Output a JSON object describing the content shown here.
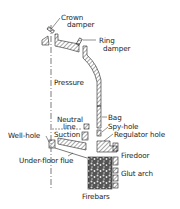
{
  "diagram": {
    "type": "kiln cross-section",
    "labels": {
      "crown_damper_1": "Crown",
      "crown_damper_2": "damper",
      "ring_damper_1": "Ring",
      "ring_damper_2": "damper",
      "pressure": "Pressure",
      "neutral_line_1": "Neutral",
      "neutral_line_2": "line",
      "suction": "Suction",
      "well_hole": "Well-hole",
      "bag": "Bag",
      "spy_hole": "Spy-hole",
      "regulator_hole": "Regulator hole",
      "firedoor": "Firedoor",
      "under_floor_flue": "Under-floor flue",
      "glut_arch": "Glut arch",
      "firebars": "Firebars"
    },
    "colors": {
      "line": "#222222",
      "background": "#ffffff"
    }
  }
}
